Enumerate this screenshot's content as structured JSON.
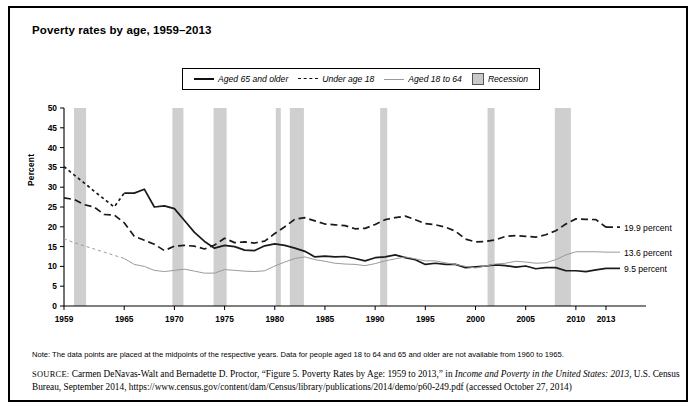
{
  "figure": {
    "title": "Poverty rates by age, 1959–2013",
    "note": "Note: The data points are placed at the midpoints of the respective years. Data for people aged 18 to 64 and 65 and older are not available from 1960 to 1965.",
    "source_prefix": "SOURCE:",
    "source_part1": " Carmen DeNavas-Walt and Bernadette D. Proctor, “Figure 5. Poverty Rates by Age: 1959 to 2013,” in ",
    "source_italic1": "Income and Poverty in the United States: 2013",
    "source_part2": ", U.S. Census Bureau, September 2014, https://www.census.gov/content/dam/Census/library/publications/2014/demo/p60-249.pdf (accessed October 27, 2014)"
  },
  "legend": {
    "items": [
      {
        "label": "Aged 65 and older",
        "style": "solid",
        "icon": "solid-line-swatch"
      },
      {
        "label": "Under age 18",
        "style": "dashed",
        "icon": "dashed-line-swatch"
      },
      {
        "label": "Aged 18 to 64",
        "style": "thin",
        "icon": "thin-line-swatch"
      },
      {
        "label": "Recession",
        "style": "box",
        "icon": "recession-box-swatch"
      }
    ]
  },
  "colors": {
    "line_65_plus": "#1a1a1a",
    "line_under_18": "#1a1a1a",
    "line_18_to_64": "#9a9a9a",
    "recession_band": "#cfcfcf",
    "axis": "#000000",
    "background": "#ffffff"
  },
  "chart_data": {
    "type": "line",
    "title": "Poverty rates by age, 1959–2013",
    "xlabel": "",
    "ylabel": "Percent",
    "xlim": [
      1959,
      2013
    ],
    "ylim": [
      0,
      50
    ],
    "yticks": [
      0,
      5,
      10,
      15,
      20,
      25,
      30,
      35,
      40,
      45,
      50
    ],
    "xticks": [
      1959,
      1965,
      1970,
      1975,
      1980,
      1985,
      1990,
      1995,
      2000,
      2005,
      2010,
      2013
    ],
    "grid": false,
    "legend_position": "top-center",
    "x": [
      1959,
      1960,
      1961,
      1962,
      1963,
      1964,
      1965,
      1966,
      1967,
      1968,
      1969,
      1970,
      1971,
      1972,
      1973,
      1974,
      1975,
      1976,
      1977,
      1978,
      1979,
      1980,
      1981,
      1982,
      1983,
      1984,
      1985,
      1986,
      1987,
      1988,
      1989,
      1990,
      1991,
      1992,
      1993,
      1994,
      1995,
      1996,
      1997,
      1998,
      1999,
      2000,
      2001,
      2002,
      2003,
      2004,
      2005,
      2006,
      2007,
      2008,
      2009,
      2010,
      2011,
      2012,
      2013
    ],
    "series": [
      {
        "name": "Aged 65 and older",
        "style": "solid",
        "interpolated_gap": [
          1960,
          1965
        ],
        "end_label": "9.5 percent",
        "values": [
          35.2,
          33.1,
          31.1,
          29.0,
          27.0,
          25.0,
          28.5,
          28.5,
          29.5,
          25.0,
          25.3,
          24.6,
          21.6,
          18.6,
          16.3,
          14.6,
          15.3,
          15.0,
          14.1,
          14.0,
          15.2,
          15.7,
          15.3,
          14.6,
          13.8,
          12.4,
          12.6,
          12.4,
          12.5,
          12.0,
          11.4,
          12.2,
          12.4,
          12.9,
          12.2,
          11.7,
          10.5,
          10.8,
          10.5,
          10.5,
          9.7,
          9.9,
          10.1,
          10.4,
          10.2,
          9.8,
          10.1,
          9.4,
          9.7,
          9.7,
          8.9,
          8.9,
          8.7,
          9.1,
          9.5
        ]
      },
      {
        "name": "Under age 18",
        "style": "dashed",
        "end_label": "19.9 percent",
        "values": [
          27.3,
          26.9,
          25.6,
          25.0,
          23.1,
          23.0,
          21.0,
          17.6,
          16.6,
          15.6,
          14.0,
          15.1,
          15.3,
          15.1,
          14.4,
          15.4,
          17.1,
          16.0,
          16.2,
          15.9,
          16.4,
          18.3,
          20.0,
          21.9,
          22.3,
          21.5,
          20.7,
          20.5,
          20.3,
          19.5,
          19.6,
          20.6,
          21.8,
          22.3,
          22.7,
          21.8,
          20.8,
          20.5,
          19.9,
          18.9,
          16.9,
          16.2,
          16.3,
          16.7,
          17.6,
          17.8,
          17.6,
          17.4,
          18.0,
          19.0,
          20.7,
          22.0,
          21.9,
          21.8,
          19.9
        ]
      },
      {
        "name": "Aged 18 to 64",
        "style": "thin",
        "interpolated_gap": [
          1960,
          1965
        ],
        "end_label": "13.6 percent",
        "values": [
          17.0,
          16.0,
          15.2,
          14.4,
          13.6,
          12.8,
          12.0,
          10.5,
          10.0,
          9.0,
          8.7,
          9.0,
          9.3,
          8.8,
          8.3,
          8.3,
          9.2,
          9.0,
          8.8,
          8.7,
          8.9,
          10.1,
          11.1,
          12.0,
          12.4,
          11.7,
          11.3,
          10.8,
          10.6,
          10.5,
          10.2,
          10.7,
          11.4,
          11.9,
          12.4,
          11.9,
          11.4,
          11.4,
          10.9,
          10.5,
          10.0,
          9.6,
          10.1,
          10.6,
          10.8,
          11.3,
          11.1,
          10.8,
          10.9,
          11.7,
          12.9,
          13.7,
          13.7,
          13.7,
          13.6
        ]
      }
    ],
    "recessions": [
      {
        "label": "1960–1961",
        "start": 1960.0,
        "end": 1961.2
      },
      {
        "label": "1969–1970",
        "start": 1969.8,
        "end": 1970.9
      },
      {
        "label": "1973–1975",
        "start": 1973.9,
        "end": 1975.2
      },
      {
        "label": "1980",
        "start": 1980.1,
        "end": 1980.6
      },
      {
        "label": "1981–1982",
        "start": 1981.5,
        "end": 1982.9
      },
      {
        "label": "1990–1991",
        "start": 1990.5,
        "end": 1991.2
      },
      {
        "label": "2001",
        "start": 2001.2,
        "end": 2001.9
      },
      {
        "label": "2007–2009",
        "start": 2007.9,
        "end": 2009.5
      }
    ]
  }
}
